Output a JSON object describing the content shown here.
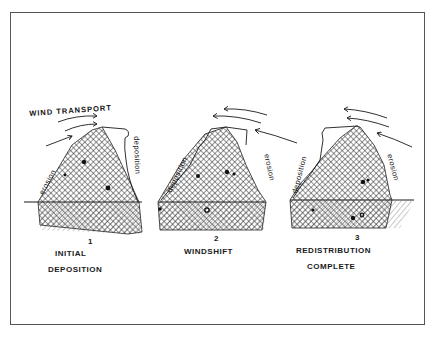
{
  "diagram": {
    "title": "WIND TRANSPORT",
    "colors": {
      "ink": "#1a1a1a",
      "frame": "#555555",
      "background": "#ffffff",
      "hatch": "#333333"
    },
    "panels": [
      {
        "number": "1",
        "caption_line1": "INITIAL",
        "caption_line2": "DEPOSITION",
        "left_slope_label": "erosion",
        "right_slope_label": "deposition",
        "wind_direction": "left-to-right"
      },
      {
        "number": "2",
        "caption_line1": "WINDSHIFT",
        "caption_line2": "",
        "left_slope_label": "deposition",
        "right_slope_label": "erosion",
        "wind_direction": "right-to-left"
      },
      {
        "number": "3",
        "caption_line1": "REDISTRIBUTION",
        "caption_line2": "COMPLETE",
        "left_slope_label": "deposition",
        "right_slope_label": "erosion",
        "wind_direction": "right-to-left"
      }
    ]
  }
}
